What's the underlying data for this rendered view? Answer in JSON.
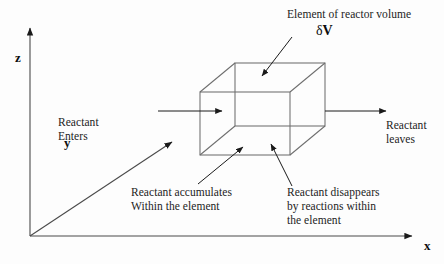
{
  "figure": {
    "title_label": "Element of reactor volume",
    "volume_symbol_delta": "δ",
    "volume_symbol_v": "V",
    "axes": {
      "z_label": "z",
      "y_label": "y",
      "x_label": "x"
    },
    "labels": {
      "inlet_line1": "Reactant",
      "inlet_line2": "Enters",
      "outlet_line1": "Reactant",
      "outlet_line2": "leaves",
      "accumulate_line1": "Reactant accumulates",
      "accumulate_line2": "Within the element",
      "disappear_line1": "Reactant disappears",
      "disappear_line2": "by reactions within",
      "disappear_line3": "the element"
    },
    "colors": {
      "ink": "#1a1a1a",
      "line": "#555555",
      "cube_line": "#6a6a6a",
      "background": "#fdfdfd"
    },
    "icons": {
      "inlet_arrow": "arrow-right-icon",
      "outlet_arrow": "arrow-right-icon",
      "z_axis_arrow": "arrow-up-icon",
      "x_axis_arrow": "arrow-right-icon",
      "y_axis_arrow": "arrow-upright-icon",
      "volume_pointer": "leader-arrow-icon",
      "accumulate_pointer": "leader-arrow-icon",
      "disappear_pointer": "leader-arrow-icon"
    }
  }
}
